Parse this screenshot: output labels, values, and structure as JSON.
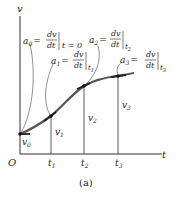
{
  "figure": {
    "caption": "(a)",
    "axes": {
      "y_label": "v",
      "x_label": "t",
      "origin_label": "O"
    },
    "ticks": [
      "t",
      "t",
      "t"
    ],
    "tick_subs": [
      "1",
      "2",
      "3"
    ],
    "velocity_labels": [
      {
        "base": "v",
        "sub": "0"
      },
      {
        "base": "v",
        "sub": "1"
      },
      {
        "base": "v",
        "sub": "2"
      },
      {
        "base": "v",
        "sub": "3"
      }
    ],
    "annotations": [
      {
        "lhs": "a",
        "sub": "0",
        "eq": "=",
        "num": "dv",
        "den": "dt",
        "eval": "t = 0"
      },
      {
        "lhs": "a",
        "sub": "1",
        "eq": "=",
        "num": "dv",
        "den": "dt",
        "eval": "t",
        "eval_sub": "1"
      },
      {
        "lhs": "a",
        "sub": "2",
        "eq": "=",
        "num": "dv",
        "den": "dt",
        "eval": "t",
        "eval_sub": "2"
      },
      {
        "lhs": "a",
        "sub": "3",
        "eq": "=",
        "num": "dv",
        "den": "dt",
        "eval": "t",
        "eval_sub": "3"
      }
    ],
    "colors": {
      "curve": "#555555",
      "axes": "#333333",
      "points": "#111111"
    }
  }
}
